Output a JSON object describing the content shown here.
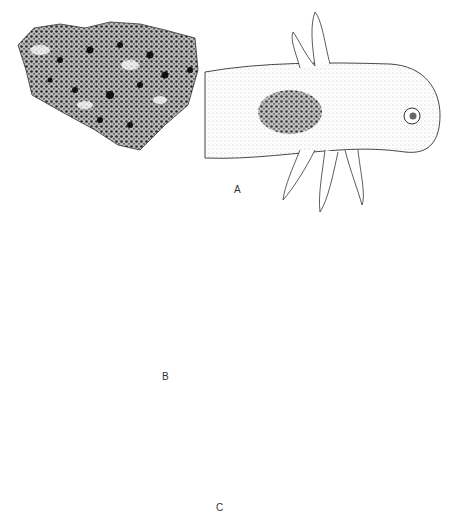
{
  "figure": {
    "panels": [
      {
        "id": "A",
        "label": "A",
        "description": "Excised pigmented skin patch (left) and axolotl larva head with external gills and pigmented graft region (right)"
      },
      {
        "id": "B",
        "label": "B",
        "description": "Two embryos; a rectangular tissue region is transplanted from donor (left) to host (right), indicated by an arrow; host site outlined with dashed line"
      },
      {
        "id": "C",
        "label": "C",
        "description": "Elongated larva with dorsal and lateral pigment stripes, eye, and gill buds"
      }
    ],
    "colors": {
      "ink": "#222222",
      "stipple": "#555555",
      "background": "#ffffff"
    }
  }
}
